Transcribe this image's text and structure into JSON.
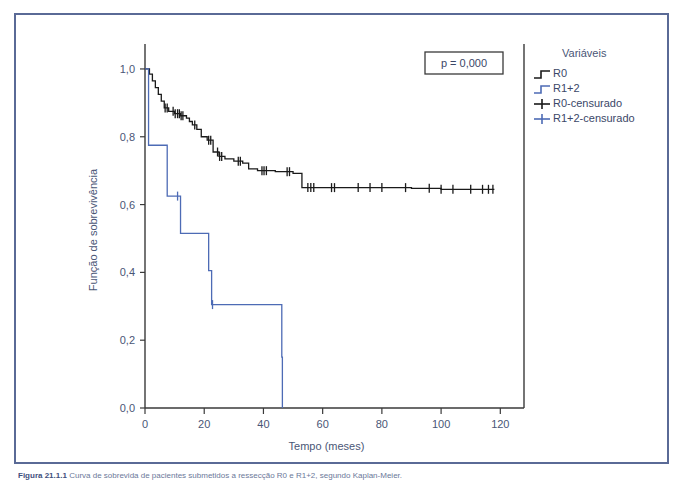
{
  "figure": {
    "caption_prefix": "Figura 21.1.1",
    "caption_text": "Curva de sobrevida de pacientes submetidos a ressecção R0 e R1+2, segundo Kaplan-Meier."
  },
  "annotation": {
    "p_value_label": "p = 0,000"
  },
  "legend": {
    "title": "Variáveis",
    "items": [
      {
        "label": "R0",
        "glyph": "step-line",
        "color": "#1a1a1a"
      },
      {
        "label": "R1+2",
        "glyph": "step-line",
        "color": "#4d6bb5"
      },
      {
        "label": "R0-censurado",
        "glyph": "plus-marker",
        "color": "#1a1a1a"
      },
      {
        "label": "R1+2-censurado",
        "glyph": "plus-marker",
        "color": "#4d6bb5"
      }
    ]
  },
  "chart_data": {
    "type": "line",
    "subtype": "kaplan-meier-step",
    "title": "",
    "xlabel": "Tempo (meses)",
    "ylabel": "Função de sobrevivência",
    "xlim": [
      0,
      128
    ],
    "ylim": [
      0.0,
      1.05
    ],
    "xticks": [
      0,
      20,
      40,
      60,
      80,
      100,
      120
    ],
    "xtick_labels": [
      "0",
      "20",
      "40",
      "60",
      "80",
      "100",
      "120"
    ],
    "yticks": [
      0.0,
      0.2,
      0.4,
      0.6,
      0.8,
      1.0
    ],
    "ytick_labels": [
      "0,0",
      "0,2",
      "0,4",
      "0,6",
      "0,8",
      "1,0"
    ],
    "grid": false,
    "legend_position": "right",
    "series": [
      {
        "name": "R0",
        "color": "#1a1a1a",
        "steps": [
          [
            0,
            1.0
          ],
          [
            1.5,
            0.985
          ],
          [
            2.5,
            0.965
          ],
          [
            3.5,
            0.945
          ],
          [
            4.5,
            0.925
          ],
          [
            5.5,
            0.905
          ],
          [
            6.5,
            0.885
          ],
          [
            8,
            0.875
          ],
          [
            10,
            0.868
          ],
          [
            12,
            0.862
          ],
          [
            14,
            0.855
          ],
          [
            15,
            0.845
          ],
          [
            16,
            0.835
          ],
          [
            17.5,
            0.822
          ],
          [
            19,
            0.8
          ],
          [
            21,
            0.79
          ],
          [
            23,
            0.755
          ],
          [
            25,
            0.742
          ],
          [
            27,
            0.735
          ],
          [
            30,
            0.728
          ],
          [
            33,
            0.722
          ],
          [
            35,
            0.705
          ],
          [
            38,
            0.7
          ],
          [
            44,
            0.697
          ],
          [
            50,
            0.692
          ],
          [
            53,
            0.65
          ],
          [
            90,
            0.648
          ],
          [
            100,
            0.645
          ],
          [
            118,
            0.645
          ]
        ],
        "censor_times": [
          6.8,
          7.5,
          9.5,
          10.2,
          11.0,
          11.6,
          12.2,
          12.8,
          16.8,
          21.5,
          22.2,
          24.5,
          25.2,
          25.9,
          31.5,
          32.2,
          39.5,
          40.2,
          41.0,
          48.0,
          48.8,
          55.0,
          56.0,
          57.0,
          63.0,
          64.0,
          72.0,
          76.0,
          80.0,
          88.0,
          96.0,
          100.0,
          104.0,
          110.0,
          114.0,
          116.0,
          117.5
        ]
      },
      {
        "name": "R1+2",
        "color": "#4d6bb5",
        "steps": [
          [
            0,
            1.0
          ],
          [
            1.0,
            1.0
          ],
          [
            1.2,
            0.775
          ],
          [
            3.0,
            0.775
          ],
          [
            7.5,
            0.625
          ],
          [
            11.5,
            0.625
          ],
          [
            12.0,
            0.515
          ],
          [
            20.5,
            0.515
          ],
          [
            21.5,
            0.405
          ],
          [
            22.5,
            0.305
          ],
          [
            46.0,
            0.305
          ],
          [
            46.2,
            0.15
          ],
          [
            46.4,
            0.0
          ]
        ],
        "censor_times": [
          11.0,
          22.8
        ]
      }
    ]
  }
}
